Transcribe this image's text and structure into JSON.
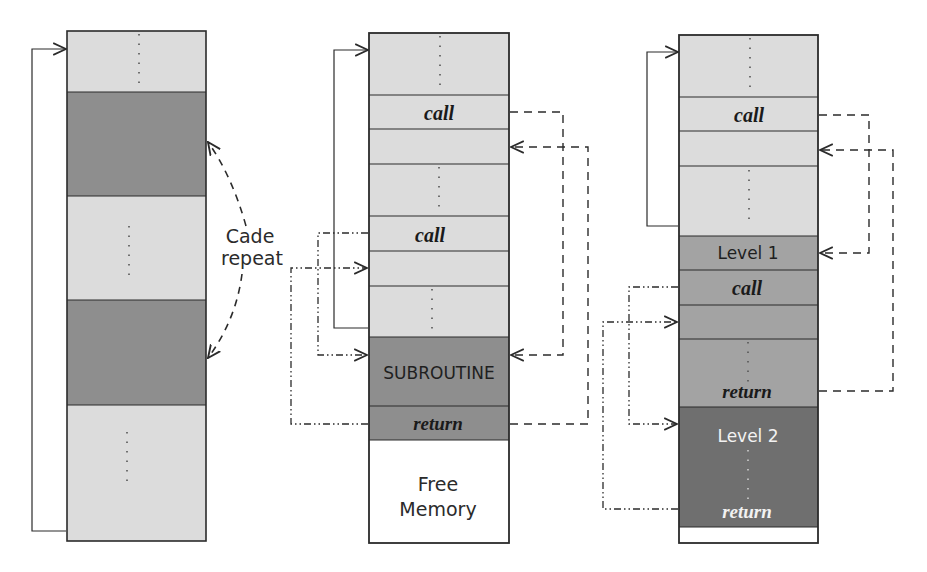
{
  "colors": {
    "light": "#dcdcdc",
    "mid": "#a3a3a3",
    "dark": "#8e8e8e",
    "darker": "#6f6f6f",
    "white": "#ffffff",
    "line": "#2b2b2b"
  },
  "diagram_left": {
    "label_line1": "Cade",
    "label_line2": "repeat",
    "segments": [
      {
        "kind": "light",
        "dots": true
      },
      {
        "kind": "dark",
        "dots": false
      },
      {
        "kind": "light",
        "dots": true
      },
      {
        "kind": "dark",
        "dots": false
      },
      {
        "kind": "light",
        "dots": true
      }
    ]
  },
  "diagram_middle": {
    "rows": [
      {
        "label": "",
        "dots": true
      },
      {
        "label": "call"
      },
      {
        "label": ""
      },
      {
        "label": "",
        "dots": true
      },
      {
        "label": "call"
      },
      {
        "label": ""
      },
      {
        "label": "",
        "dots": true
      },
      {
        "label": "SUBROUTINE"
      },
      {
        "label": "return"
      },
      {
        "label": "Free Memory"
      }
    ],
    "call_label": "call",
    "call2_label": "call",
    "subroutine_label": "SUBROUTINE",
    "return_label": "return",
    "free_line1": "Free",
    "free_line2": "Memory"
  },
  "diagram_right": {
    "call_label": "call",
    "level1_label": "Level 1",
    "call2_label": "call",
    "return_label": "return",
    "level2_label": "Level 2",
    "return2_label": "return"
  }
}
